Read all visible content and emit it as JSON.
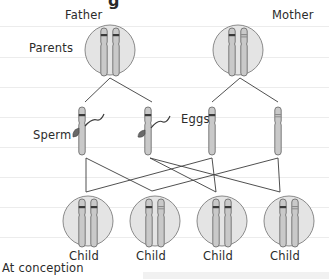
{
  "figure": {
    "title_fragment": "g",
    "labels": {
      "father": "Father",
      "mother": "Mother",
      "parents": "Parents",
      "sperm": "Sperm",
      "eggs": "Eggs",
      "at_conception": "At conception"
    },
    "children": [
      {
        "label": "Child",
        "chromosomes": [
          "father-banded",
          "mother-banded"
        ]
      },
      {
        "label": "Child",
        "chromosomes": [
          "father-banded",
          "mother-light"
        ]
      },
      {
        "label": "Child",
        "chromosomes": [
          "father-light-banded",
          "mother-banded"
        ]
      },
      {
        "label": "Child",
        "chromosomes": [
          "father-light-banded",
          "mother-light"
        ]
      }
    ],
    "colors": {
      "circle_fill": "#e4e4e4",
      "circle_stroke": "#8a8a8a",
      "chromosome_fill": "#c9c9c9",
      "chromosome_stroke": "#6e6e6e",
      "band_dark": "#3a3a3a",
      "band_light": "#9a9a9a",
      "line": "#3c3c3c",
      "ruled_line": "#ececec"
    }
  }
}
